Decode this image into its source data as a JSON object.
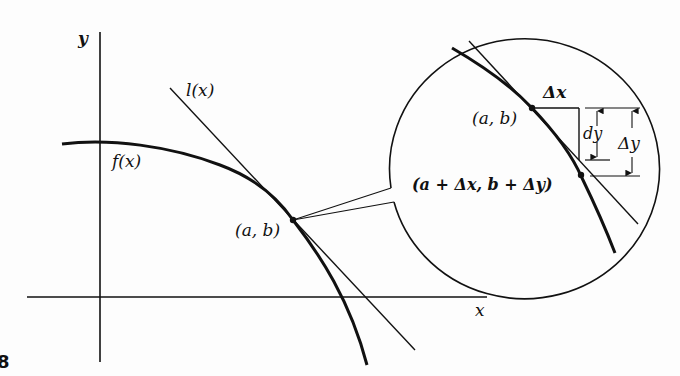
{
  "diagram": {
    "figure_number": "8",
    "axes": {
      "x_label": "x",
      "y_label": "y"
    },
    "curves": {
      "function_label": "f(x)",
      "tangent_label": "l(x)"
    },
    "main_point_label": "(a, b)",
    "magnifier": {
      "point_label": "(a, b)",
      "second_point_label": "(a + Δx, b + Δy)",
      "delta_x_label": "Δx",
      "dy_label": "dy",
      "delta_y_label": "Δy"
    },
    "colors": {
      "ink": "#111111",
      "background": "#fdfdfd"
    }
  }
}
